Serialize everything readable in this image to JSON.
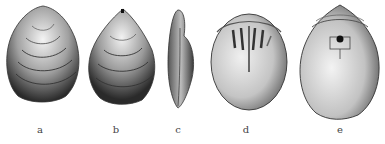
{
  "figure": {
    "labels": [
      "a",
      "b",
      "c",
      "d",
      "e"
    ],
    "views": [
      {
        "id": "a",
        "view": "exterior valve with concentric growth lines"
      },
      {
        "id": "b",
        "view": "exterior valve, narrower with pointed beak"
      },
      {
        "id": "c",
        "view": "lateral profile"
      },
      {
        "id": "d",
        "view": "interior of valve with septa / muscle scars"
      },
      {
        "id": "e",
        "view": "interior of valve with foramen and hinge area"
      }
    ]
  },
  "colors": {
    "background": "#ffffff",
    "ink_dark": "#2a2a2a",
    "ink_mid": "#7a7a7a",
    "ink_light": "#d8d8d8"
  }
}
